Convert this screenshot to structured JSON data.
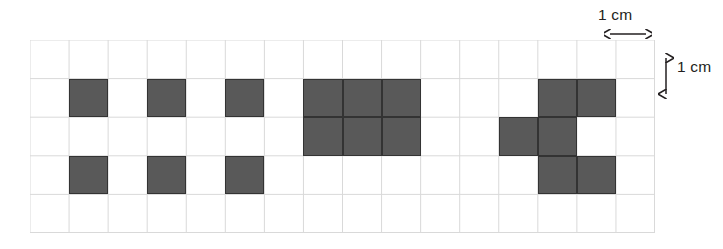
{
  "figure": {
    "title": "",
    "background_color": "#ffffff",
    "grid": {
      "columns": 16,
      "rows": 5,
      "cell_size_px": 39.06,
      "origin_x_px": 30,
      "origin_y_px": 40,
      "width_px": 625,
      "height_px": 193,
      "line_color": "#d9d9d9",
      "line_width_px": 1,
      "visible": true
    },
    "shape_style": {
      "fill_color": "#595959",
      "stroke_color": "#333333",
      "stroke_width_px": 1.4
    },
    "annotations": [
      {
        "id": "horizontal-scale",
        "label": "1 cm",
        "orientation": "horizontal",
        "arrow": "double-headed",
        "meaning": "one grid cell width equals 1 cm"
      },
      {
        "id": "vertical-scale",
        "label": "1 cm",
        "orientation": "vertical",
        "arrow": "double-headed",
        "meaning": "one grid cell height equals 1 cm"
      }
    ],
    "shapes": [
      {
        "id": "shape-1",
        "name": "six-scattered-squares",
        "description": "Six separate unit squares arranged in two rows of three, spaced one empty column apart",
        "unit_squares": 6,
        "area_cm2": 6,
        "cells": [
          {
            "col": 1,
            "row": 1
          },
          {
            "col": 3,
            "row": 1
          },
          {
            "col": 5,
            "row": 1
          },
          {
            "col": 1,
            "row": 3
          },
          {
            "col": 3,
            "row": 3
          },
          {
            "col": 5,
            "row": 3
          }
        ]
      },
      {
        "id": "shape-2",
        "name": "three-by-two-rectangle",
        "description": "Solid rectangle three units wide and two units tall",
        "unit_squares": 6,
        "area_cm2": 6,
        "cells": [
          {
            "col": 7,
            "row": 1
          },
          {
            "col": 8,
            "row": 1
          },
          {
            "col": 9,
            "row": 1
          },
          {
            "col": 7,
            "row": 2
          },
          {
            "col": 8,
            "row": 2
          },
          {
            "col": 9,
            "row": 2
          }
        ]
      },
      {
        "id": "shape-3",
        "name": "zigzag-hexomino",
        "description": "Staircase zigzag figure made of six unit squares",
        "unit_squares": 6,
        "area_cm2": 6,
        "cells": [
          {
            "col": 13,
            "row": 1
          },
          {
            "col": 14,
            "row": 1
          },
          {
            "col": 12,
            "row": 2
          },
          {
            "col": 13,
            "row": 2
          },
          {
            "col": 13,
            "row": 3
          },
          {
            "col": 14,
            "row": 3
          }
        ]
      }
    ]
  }
}
